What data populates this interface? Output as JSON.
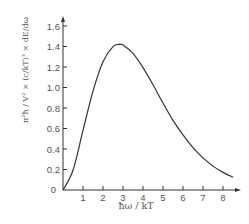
{
  "chart_data": {
    "type": "line",
    "title": "",
    "xlabel": "ħω / kT",
    "ylabel": "π²ħ / V² × (c/kT)³ × dE/dω",
    "xlim": [
      0,
      8.7
    ],
    "ylim": [
      0,
      1.65
    ],
    "x_ticks": [
      1,
      2,
      3,
      4,
      5,
      6,
      7,
      8
    ],
    "y_ticks": [
      0,
      0.2,
      0.4,
      0.6,
      0.8,
      1.0,
      1.2,
      1.4,
      1.6
    ],
    "y_tick_labels": [
      "0",
      "0.2",
      "0.4",
      "0.6",
      "0.8",
      "1.0",
      "1.2",
      "1.4",
      "1.6"
    ],
    "origin_label": "0",
    "grid": false,
    "legend": null,
    "series": [
      {
        "name": "Planck spectral energy density",
        "x": [
          0,
          0.5,
          1,
          1.5,
          2,
          2.5,
          2.82,
          3,
          3.5,
          4,
          4.5,
          5,
          5.5,
          6,
          6.5,
          7,
          7.5,
          8,
          8.5
        ],
        "values": [
          0,
          0.193,
          0.582,
          0.965,
          1.252,
          1.398,
          1.421,
          1.414,
          1.332,
          1.194,
          1.027,
          0.848,
          0.679,
          0.537,
          0.413,
          0.313,
          0.233,
          0.172,
          0.125
        ]
      }
    ]
  },
  "colors": {
    "axis": "#333333",
    "curve": "#333333",
    "text": "#555555"
  }
}
